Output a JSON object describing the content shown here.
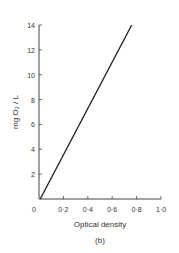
{
  "chart_data": {
    "type": "line",
    "title": "",
    "panel_label": "(b)",
    "xlabel": "Optical density",
    "ylabel": "mg O₂ / L",
    "xlim": [
      0,
      1.0
    ],
    "ylim": [
      0,
      14
    ],
    "x_ticks": [
      "0",
      "0·2",
      "0·4",
      "0·6",
      "0·8",
      "1·0"
    ],
    "x_tick_values": [
      0,
      0.2,
      0.4,
      0.6,
      0.8,
      1.0
    ],
    "y_ticks": [
      "2",
      "4",
      "6",
      "8",
      "10",
      "12",
      "14"
    ],
    "y_tick_values": [
      2,
      4,
      6,
      8,
      10,
      12,
      14
    ],
    "grid": false,
    "series": [
      {
        "name": "calibration",
        "x": [
          0.01,
          0.76
        ],
        "y": [
          0,
          14
        ],
        "color": "#1a1a1a"
      }
    ]
  }
}
